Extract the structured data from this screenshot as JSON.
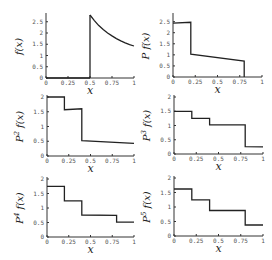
{
  "chart_data": [
    {
      "type": "line",
      "title": "",
      "ylabel": "f(x)",
      "ylabel_base": "f(x)",
      "ylabel_sup": "",
      "xlabel": "x",
      "xlim": [
        0,
        1
      ],
      "ylim": [
        0,
        2.8
      ],
      "xticks": [
        "0",
        "0.25",
        "0.5",
        "0.75",
        "1"
      ],
      "yticks": [
        0,
        0.5,
        1,
        1.5,
        2,
        2.5
      ],
      "ytick_labels": [
        "0",
        "0.5",
        "1",
        "1.5",
        "2",
        "2.5"
      ],
      "segments": [
        {
          "x": [
            0,
            0.5
          ],
          "y": [
            0,
            0
          ]
        },
        {
          "x": [
            0.5,
            0.5
          ],
          "y": [
            0,
            2.8
          ]
        },
        {
          "x": [
            0.5,
            0.55,
            0.6,
            0.65,
            0.7,
            0.75,
            0.8,
            0.85,
            0.9,
            0.95,
            1.0
          ],
          "y": [
            2.8,
            2.55,
            2.33,
            2.15,
            2.0,
            1.87,
            1.75,
            1.65,
            1.56,
            1.48,
            1.42
          ]
        }
      ]
    },
    {
      "type": "line",
      "ylabel": "P f(x)",
      "ylabel_base": "P f(x)",
      "ylabel_sup": "",
      "xlabel": "x",
      "xlim": [
        0,
        1
      ],
      "ylim": [
        0,
        2.8
      ],
      "xticks": [
        "0",
        "0.25",
        "0.5",
        "0.75",
        "1"
      ],
      "yticks": [
        0,
        0.5,
        1,
        1.5,
        2,
        2.5
      ],
      "ytick_labels": [
        "0",
        "0.5",
        "1",
        "1.5",
        "2",
        "2.5"
      ],
      "segments": [
        {
          "x": [
            0,
            0.2,
            0.2,
            0.8,
            0.8
          ],
          "y": [
            2.43,
            2.47,
            1.03,
            0.72,
            0
          ]
        }
      ]
    },
    {
      "type": "line",
      "ylabel": "P^2 f(x)",
      "ylabel_base": "P",
      "ylabel_sup": "2",
      "xlabel": "x",
      "xlim": [
        0,
        1
      ],
      "ylim": [
        0,
        2
      ],
      "xticks": [
        "0",
        "0.25",
        "0.5",
        "0.75",
        "1"
      ],
      "yticks": [
        0,
        0.5,
        1,
        1.5,
        2
      ],
      "ytick_labels": [
        "0",
        "0.5",
        "1",
        "1.5",
        "2"
      ],
      "segments": [
        {
          "x": [
            0,
            0.2,
            0.2,
            0.4,
            0.4,
            1.0
          ],
          "y": [
            2.0,
            2.0,
            1.57,
            1.6,
            0.52,
            0.43
          ]
        }
      ]
    },
    {
      "type": "line",
      "ylabel": "P^3 f(x)",
      "ylabel_base": "P",
      "ylabel_sup": "3",
      "xlabel": "x",
      "xlim": [
        0,
        1
      ],
      "ylim": [
        0,
        2
      ],
      "xticks": [
        "0",
        "0.25",
        "0.5",
        "0.75",
        "1"
      ],
      "yticks": [
        0,
        0.5,
        1,
        1.5,
        2
      ],
      "ytick_labels": [
        "0",
        "0.5",
        "1",
        "1.5",
        "2"
      ],
      "segments": [
        {
          "x": [
            0,
            0.2,
            0.2,
            0.4,
            0.4,
            0.8,
            0.8,
            1.0
          ],
          "y": [
            1.5,
            1.5,
            1.25,
            1.25,
            1.02,
            1.02,
            0.26,
            0.25
          ]
        }
      ]
    },
    {
      "type": "line",
      "ylabel": "P^4 f(x)",
      "ylabel_base": "P",
      "ylabel_sup": "4",
      "xlabel": "x",
      "xlim": [
        0,
        1
      ],
      "ylim": [
        0,
        2
      ],
      "xticks": [
        "0",
        "0.25",
        "0.5",
        "0.75",
        "1"
      ],
      "yticks": [
        0,
        0.5,
        1,
        1.5,
        2
      ],
      "ytick_labels": [
        "0",
        "0.5",
        "1",
        "1.5",
        "2"
      ],
      "segments": [
        {
          "x": [
            0,
            0.2,
            0.2,
            0.4,
            0.4,
            0.8,
            0.8,
            1.0
          ],
          "y": [
            1.75,
            1.75,
            1.25,
            1.25,
            0.76,
            0.75,
            0.51,
            0.51
          ]
        }
      ]
    },
    {
      "type": "line",
      "ylabel": "P^5 f(x)",
      "ylabel_base": "P",
      "ylabel_sup": "5",
      "xlabel": "x",
      "xlim": [
        0,
        1
      ],
      "ylim": [
        0,
        2
      ],
      "xticks": [
        "0",
        "0.25",
        "0.5",
        "0.75",
        "1"
      ],
      "yticks": [
        0,
        0.5,
        1,
        1.5,
        2
      ],
      "ytick_labels": [
        "0",
        "0.5",
        "1",
        "1.5",
        "2"
      ],
      "segments": [
        {
          "x": [
            0,
            0.2,
            0.2,
            0.4,
            0.4,
            0.8,
            0.8,
            1.0
          ],
          "y": [
            1.62,
            1.62,
            1.25,
            1.25,
            0.88,
            0.88,
            0.38,
            0.38
          ]
        }
      ]
    }
  ],
  "layout": {
    "panels": [
      {
        "x0": 46,
        "x1": 134,
        "y0": 78,
        "ytop": 15,
        "ytop_val": 2.8
      },
      {
        "x0": 173,
        "x1": 262,
        "y0": 77,
        "ytop": 15,
        "ytop_val": 2.8
      },
      {
        "x0": 47,
        "x1": 134,
        "y0": 156,
        "ytop": 97,
        "ytop_val": 2
      },
      {
        "x0": 174,
        "x1": 263,
        "y0": 154,
        "ytop": 97,
        "ytop_val": 2
      },
      {
        "x0": 47,
        "x1": 134,
        "y0": 237,
        "ytop": 179,
        "ytop_val": 2
      },
      {
        "x0": 174,
        "x1": 263,
        "y0": 236,
        "ytop": 178,
        "ytop_val": 2
      }
    ]
  }
}
